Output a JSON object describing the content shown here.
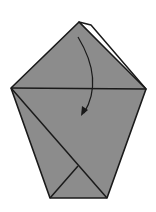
{
  "diagram": {
    "type": "origami-fold-step",
    "colors": {
      "paper_colored": "#8c8c8c",
      "paper_white": "#ffffff",
      "line": "#1a1a1a",
      "background": "#ffffff"
    },
    "shape": {
      "apex": [
        79,
        22
      ],
      "left_corner": [
        11,
        88
      ],
      "right_corner": [
        146,
        89
      ],
      "bottom_left": [
        50,
        198
      ],
      "bottom_right": [
        107,
        198
      ]
    },
    "back_flap": {
      "peak": [
        91,
        25
      ],
      "end": [
        144,
        83
      ]
    },
    "creases": {
      "horizontal": [
        [
          11,
          88
        ],
        [
          146,
          89
        ]
      ],
      "diagonal": [
        [
          11,
          88
        ],
        [
          107,
          198
        ]
      ],
      "inner": [
        [
          50,
          198
        ],
        [
          78,
          166
        ]
      ]
    },
    "arrow": {
      "start": [
        78,
        37
      ],
      "control": [
        104,
        80
      ],
      "end": [
        84,
        113
      ],
      "meaning": "fold-down"
    }
  }
}
